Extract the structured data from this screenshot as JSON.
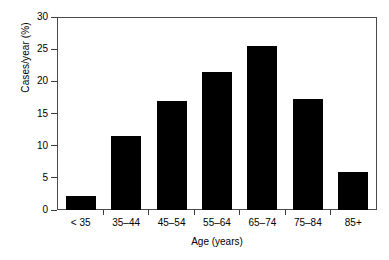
{
  "chart_data": {
    "type": "bar",
    "title": "",
    "subtitle": "",
    "xlabel": "Age (years)",
    "ylabel": "Cases/year (%)",
    "categories": [
      "< 35",
      "35–44",
      "45–54",
      "55–64",
      "65–74",
      "75–84",
      "85+"
    ],
    "values": [
      2.2,
      11.6,
      17.0,
      21.5,
      25.6,
      17.4,
      5.9
    ],
    "series": [
      {
        "name": "Cases/year (%)",
        "values": [
          2.2,
          11.6,
          17.0,
          21.5,
          25.6,
          17.4,
          5.9
        ]
      }
    ],
    "ylim": [
      0,
      30
    ],
    "yticks": [
      0,
      5,
      10,
      15,
      20,
      25,
      30
    ],
    "ytick_labels": [
      "0",
      "5",
      "10",
      "15",
      "20",
      "25",
      "30"
    ],
    "xtick_labels": [
      "< 35",
      "35–44",
      "45–54",
      "55–64",
      "65–74",
      "75–84",
      "85+"
    ],
    "grid": false,
    "legend": false,
    "legend_position": "none",
    "bar_color": "#000000",
    "axis_color": "#3c3c3c",
    "background_color": "#ffffff",
    "annotations": []
  }
}
